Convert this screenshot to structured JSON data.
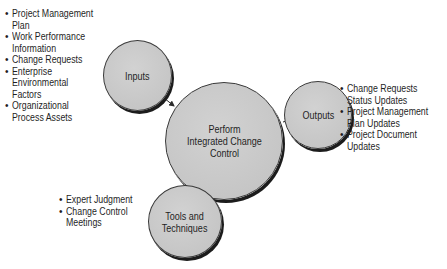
{
  "diagram": {
    "center": {
      "label": "Perform\nIntegrated Change\nControl"
    },
    "inputs": {
      "label": "Inputs",
      "items": [
        "Project Management Plan",
        "Work Performance\nInformation",
        "Change Requests",
        "Enterprise\nEnvironmental\nFactors",
        "Organizational\nProcess Assets"
      ]
    },
    "tools": {
      "label": "Tools and\nTechniques",
      "items": [
        "Expert Judgment",
        "Change Control\nMeetings"
      ]
    },
    "outputs": {
      "label": "Outputs",
      "items": [
        "Change Requests\nStatus Updates",
        "Project Management\nPlan Updates",
        "Project Document\nUpdates"
      ]
    },
    "colors": {
      "circle_fill": "#c8c8c8",
      "circle_shadow": "#1c1c1c",
      "arrow": "#2a2a2a",
      "background": "#ffffff"
    }
  }
}
